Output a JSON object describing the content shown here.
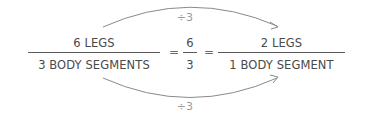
{
  "diagram": {
    "left_fraction": {
      "numerator": "6 LEGS",
      "denominator": "3 BODY SEGMENTS"
    },
    "equals_1": "=",
    "middle_fraction": {
      "numerator": "6",
      "denominator": "3"
    },
    "equals_2": "=",
    "right_fraction": {
      "numerator": "2 LEGS",
      "denominator": "1 BODY SEGMENT"
    },
    "top_arrow": {
      "label": "÷3"
    },
    "bottom_arrow": {
      "label": "÷3"
    },
    "colors": {
      "text": "#4a4a4a",
      "arrow": "#8a8a8a",
      "label": "#9a9a9a"
    }
  }
}
